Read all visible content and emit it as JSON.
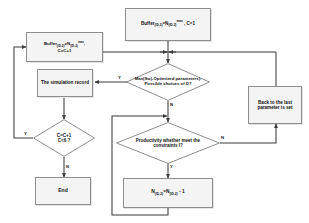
{
  "diagram": {
    "type": "flowchart",
    "nodes": {
      "start_buffer": {
        "label": "Buffer(ID-2)=N(ID-2)^max , C=1",
        "shape": "process"
      },
      "buffer_increment": {
        "label": "Buffer(ID-2)=N(ID-2)^max, C=C+1",
        "shape": "process"
      },
      "max_sw_decision": {
        "label": "Max(Sw)-Optimized parameters). Possible choices of D?",
        "shape": "decision"
      },
      "simulation_record": {
        "label": "The simulation record",
        "shape": "process"
      },
      "back_to_last": {
        "label": "Back to the last parameter is set",
        "shape": "process"
      },
      "counter_decision": {
        "label_line1": "C=C+1",
        "label_line2": "C<6 ?",
        "shape": "decision"
      },
      "productivity_decision": {
        "label": "Productivity whether meet the constraints I?",
        "shape": "decision"
      },
      "decrement_n": {
        "label": "N(ID-2)=N(ID-2) - 1",
        "shape": "process"
      },
      "end": {
        "label": "End",
        "shape": "terminator"
      }
    },
    "edge_labels": {
      "max_yes": "Y",
      "max_no": "N",
      "counter_yes": "Y",
      "counter_no": "N",
      "productivity_yes": "Y",
      "productivity_no": "N"
    },
    "colors": {
      "node_fill": "#f4f4f4",
      "node_stroke": "#8d8d8d",
      "line": "#3b3b3b",
      "text": "#111111",
      "background": "#ffffff"
    }
  }
}
